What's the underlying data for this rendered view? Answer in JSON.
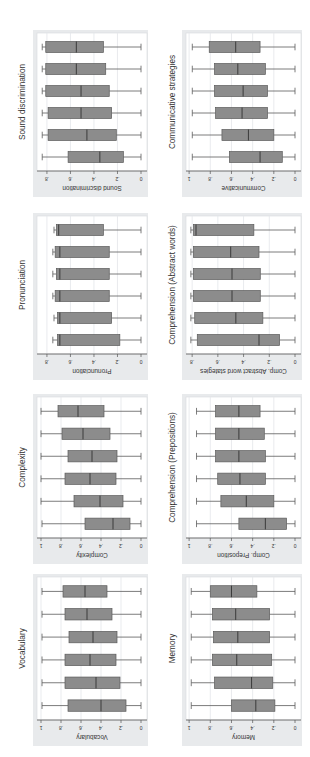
{
  "figure": {
    "orientation": "rotated-90-ccw",
    "background": "#ffffff",
    "panel_bg": "#e8eaec",
    "plot_bg": "#ffffff",
    "box_fill": "#8c8c8c",
    "box_stroke": "#5a5a5a",
    "grid_color": "#e3e6ea",
    "text_color": "#333333"
  },
  "chart_data": [
    {
      "type": "boxplot",
      "title": "Sound discrimination",
      "ylabel": "Sound discrimination",
      "ticks": [
        0,
        0.2,
        0.4,
        0.6,
        0.8
      ],
      "tick_labels": [
        "0",
        ".2",
        ".4",
        ".6",
        ".8"
      ],
      "range": [
        0,
        0.876
      ],
      "grid": true,
      "groups": [
        {
          "wmin": 0,
          "q1": 0.15,
          "median": 0.35,
          "q3": 0.62,
          "wmax": 0.84
        },
        {
          "wmin": 0,
          "q1": 0.21,
          "median": 0.46,
          "q3": 0.79,
          "wmax": 0.84
        },
        {
          "wmin": 0,
          "q1": 0.25,
          "median": 0.51,
          "q3": 0.79,
          "wmax": 0.84
        },
        {
          "wmin": 0,
          "q1": 0.27,
          "median": 0.51,
          "q3": 0.81,
          "wmax": 0.84
        },
        {
          "wmin": 0,
          "q1": 0.3,
          "median": 0.55,
          "q3": 0.81,
          "wmax": 0.84
        },
        {
          "wmin": 0,
          "q1": 0.32,
          "median": 0.55,
          "q3": 0.81,
          "wmax": 0.84
        }
      ]
    },
    {
      "type": "boxplot",
      "title": "Pronunciation",
      "ylabel": "Pronunciation",
      "ticks": [
        0,
        0.2,
        0.4,
        0.6,
        0.8
      ],
      "tick_labels": [
        "0",
        ".2",
        ".4",
        ".6",
        ".8"
      ],
      "range": [
        0,
        0.876
      ],
      "grid": true,
      "groups": [
        {
          "wmin": 0,
          "q1": 0.18,
          "median": 0.69,
          "q3": 0.71,
          "wmax": 0.75
        },
        {
          "wmin": 0,
          "q1": 0.25,
          "median": 0.69,
          "q3": 0.71,
          "wmax": 0.74
        },
        {
          "wmin": 0,
          "q1": 0.27,
          "median": 0.69,
          "q3": 0.73,
          "wmax": 0.75
        },
        {
          "wmin": 0,
          "q1": 0.27,
          "median": 0.69,
          "q3": 0.72,
          "wmax": 0.75
        },
        {
          "wmin": 0,
          "q1": 0.27,
          "median": 0.69,
          "q3": 0.73,
          "wmax": 0.75
        },
        {
          "wmin": 0,
          "q1": 0.32,
          "median": 0.7,
          "q3": 0.72,
          "wmax": 0.74
        }
      ]
    },
    {
      "type": "boxplot",
      "title": "Complexity",
      "ylabel": "Complexity",
      "ticks": [
        0,
        0.2,
        0.4,
        0.6,
        0.8,
        1
      ],
      "tick_labels": [
        "0",
        ".2",
        ".4",
        ".6",
        ".8",
        "1"
      ],
      "range": [
        0,
        1.03
      ],
      "grid": true,
      "groups": [
        {
          "wmin": 0,
          "q1": 0.11,
          "median": 0.28,
          "q3": 0.56,
          "wmax": 0.99
        },
        {
          "wmin": 0,
          "q1": 0.18,
          "median": 0.41,
          "q3": 0.67,
          "wmax": 1.0
        },
        {
          "wmin": 0,
          "q1": 0.25,
          "median": 0.51,
          "q3": 0.76,
          "wmax": 1.0
        },
        {
          "wmin": 0,
          "q1": 0.24,
          "median": 0.49,
          "q3": 0.73,
          "wmax": 1.0
        },
        {
          "wmin": 0,
          "q1": 0.31,
          "median": 0.58,
          "q3": 0.79,
          "wmax": 1.0
        },
        {
          "wmin": 0,
          "q1": 0.37,
          "median": 0.63,
          "q3": 0.83,
          "wmax": 1.0
        }
      ]
    },
    {
      "type": "boxplot",
      "title": "Vocabulary",
      "ylabel": "Vocabulary",
      "ticks": [
        0,
        0.2,
        0.4,
        0.6,
        0.8,
        1
      ],
      "tick_labels": [
        "0",
        ".2",
        ".4",
        ".6",
        ".8",
        "1"
      ],
      "range": [
        0,
        1.03
      ],
      "grid": true,
      "groups": [
        {
          "wmin": 0,
          "q1": 0.15,
          "median": 0.4,
          "q3": 0.73,
          "wmax": 0.99
        },
        {
          "wmin": 0,
          "q1": 0.21,
          "median": 0.45,
          "q3": 0.76,
          "wmax": 0.99
        },
        {
          "wmin": 0,
          "q1": 0.25,
          "median": 0.51,
          "q3": 0.76,
          "wmax": 0.99
        },
        {
          "wmin": 0,
          "q1": 0.24,
          "median": 0.48,
          "q3": 0.72,
          "wmax": 0.99
        },
        {
          "wmin": 0,
          "q1": 0.29,
          "median": 0.54,
          "q3": 0.76,
          "wmax": 0.99
        },
        {
          "wmin": 0,
          "q1": 0.34,
          "median": 0.56,
          "q3": 0.78,
          "wmax": 0.99
        }
      ]
    },
    {
      "type": "boxplot",
      "title": "Communicative strategies",
      "ylabel": "Communicative",
      "ticks": [
        0,
        0.2,
        0.4,
        0.6,
        0.8,
        1
      ],
      "tick_labels": [
        "0",
        ".2",
        ".4",
        ".6",
        ".8",
        "1"
      ],
      "range": [
        0,
        1.02
      ],
      "grid": true,
      "groups": [
        {
          "wmin": 0,
          "q1": 0.12,
          "median": 0.33,
          "q3": 0.62,
          "wmax": 0.97
        },
        {
          "wmin": 0,
          "q1": 0.2,
          "median": 0.44,
          "q3": 0.69,
          "wmax": 0.97
        },
        {
          "wmin": 0,
          "q1": 0.26,
          "median": 0.5,
          "q3": 0.75,
          "wmax": 0.97
        },
        {
          "wmin": 0,
          "q1": 0.26,
          "median": 0.49,
          "q3": 0.76,
          "wmax": 0.97
        },
        {
          "wmin": 0,
          "q1": 0.28,
          "median": 0.54,
          "q3": 0.76,
          "wmax": 0.97
        },
        {
          "wmin": 0,
          "q1": 0.33,
          "median": 0.56,
          "q3": 0.81,
          "wmax": 0.97
        }
      ]
    },
    {
      "type": "boxplot",
      "title": "Comprehension (Abstract words)",
      "ylabel": "Comp. Abstract word stategies",
      "ticks": [
        0,
        0.2,
        0.4,
        0.6,
        0.8
      ],
      "tick_labels": [
        "0",
        ".2",
        ".4",
        ".6",
        ".8"
      ],
      "range": [
        0,
        0.84
      ],
      "grid": true,
      "groups": [
        {
          "wmin": 0,
          "q1": 0.12,
          "median": 0.28,
          "q3": 0.76,
          "wmax": 0.81
        },
        {
          "wmin": 0,
          "q1": 0.25,
          "median": 0.46,
          "q3": 0.78,
          "wmax": 0.81
        },
        {
          "wmin": 0,
          "q1": 0.27,
          "median": 0.49,
          "q3": 0.79,
          "wmax": 0.81
        },
        {
          "wmin": 0,
          "q1": 0.27,
          "median": 0.49,
          "q3": 0.79,
          "wmax": 0.81
        },
        {
          "wmin": 0,
          "q1": 0.28,
          "median": 0.5,
          "q3": 0.79,
          "wmax": 0.81
        },
        {
          "wmin": 0,
          "q1": 0.32,
          "median": 0.77,
          "q3": 0.79,
          "wmax": 0.81
        }
      ]
    },
    {
      "type": "boxplot",
      "title": "Comprehension (Prepositions)",
      "ylabel": "Comp. Preposition",
      "ticks": [
        0,
        0.2,
        0.4,
        0.6,
        0.8,
        1
      ],
      "tick_labels": [
        "0",
        ".2",
        ".4",
        ".6",
        ".8",
        "1"
      ],
      "range": [
        0,
        1.02
      ],
      "grid": true,
      "groups": [
        {
          "wmin": 0,
          "q1": 0.08,
          "median": 0.28,
          "q3": 0.53,
          "wmax": 0.93
        },
        {
          "wmin": 0,
          "q1": 0.2,
          "median": 0.46,
          "q3": 0.7,
          "wmax": 0.93
        },
        {
          "wmin": 0,
          "q1": 0.28,
          "median": 0.52,
          "q3": 0.73,
          "wmax": 0.93
        },
        {
          "wmin": 0,
          "q1": 0.28,
          "median": 0.53,
          "q3": 0.75,
          "wmax": 0.93
        },
        {
          "wmin": 0,
          "q1": 0.29,
          "median": 0.53,
          "q3": 0.75,
          "wmax": 0.93
        },
        {
          "wmin": 0,
          "q1": 0.33,
          "median": 0.53,
          "q3": 0.75,
          "wmax": 0.93
        }
      ]
    },
    {
      "type": "boxplot",
      "title": "Memory",
      "ylabel": "Memory",
      "ticks": [
        0,
        0.2,
        0.4,
        0.6,
        0.8,
        1
      ],
      "tick_labels": [
        "0",
        ".2",
        ".4",
        ".6",
        ".8",
        "1"
      ],
      "range": [
        0,
        1.02
      ],
      "grid": true,
      "groups": [
        {
          "wmin": 0,
          "q1": 0.19,
          "median": 0.37,
          "q3": 0.6,
          "wmax": 0.98
        },
        {
          "wmin": 0,
          "q1": 0.21,
          "median": 0.41,
          "q3": 0.76,
          "wmax": 0.98
        },
        {
          "wmin": 0,
          "q1": 0.22,
          "median": 0.55,
          "q3": 0.78,
          "wmax": 0.98
        },
        {
          "wmin": 0,
          "q1": 0.24,
          "median": 0.54,
          "q3": 0.77,
          "wmax": 0.98
        },
        {
          "wmin": 0,
          "q1": 0.24,
          "median": 0.56,
          "q3": 0.78,
          "wmax": 0.98
        },
        {
          "wmin": 0,
          "q1": 0.36,
          "median": 0.6,
          "q3": 0.8,
          "wmax": 0.98
        }
      ]
    }
  ]
}
